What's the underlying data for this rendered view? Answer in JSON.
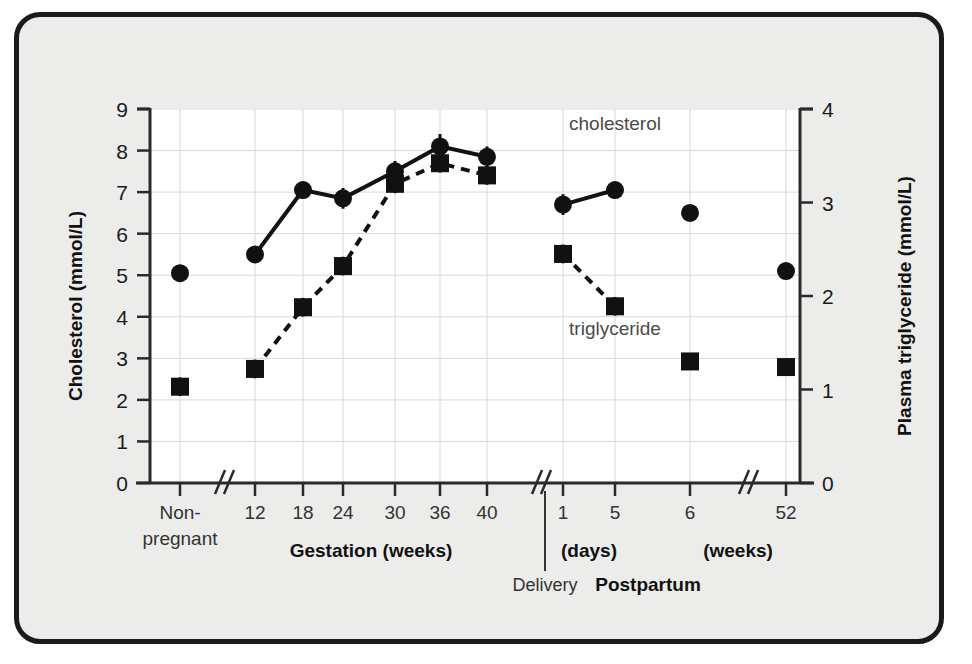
{
  "figure": {
    "background_color": "#ececea",
    "frame_color": "#1a1a1a",
    "plot_background": "#ffffff"
  },
  "chart_data": {
    "type": "line",
    "title": "",
    "xlabel": "",
    "ylabel": "Cholesterol (mmol/L)",
    "y2label": "Plasma triglyceride (mmol/L)",
    "ylim": [
      0,
      9
    ],
    "y2lim": [
      0,
      4
    ],
    "yticks": [
      "0",
      "1",
      "2",
      "3",
      "4",
      "5",
      "6",
      "7",
      "8",
      "9"
    ],
    "y2ticks": [
      "0",
      "1",
      "2",
      "3",
      "4"
    ],
    "grid": true,
    "legend_position": "inline-annotation",
    "categories": [
      "Non-pregnant",
      "12",
      "18",
      "24",
      "30",
      "36",
      "40",
      "1",
      "5",
      "6",
      "52"
    ],
    "axis_breaks": [
      "after Non-pregnant",
      "after 40 (Delivery)",
      "after 6 weeks"
    ],
    "series": [
      {
        "name": "cholesterol",
        "axis": "left",
        "marker": "circle",
        "linestyle": "solid",
        "units": "mmol/L",
        "values": [
          5.05,
          5.5,
          7.05,
          6.85,
          7.5,
          8.1,
          7.85,
          6.7,
          7.05,
          6.5,
          5.1
        ],
        "errors": [
          0.2,
          0.2,
          0.2,
          0.25,
          0.25,
          0.3,
          0.25,
          0.25,
          0.2,
          0.15,
          0.15
        ],
        "connected_segments": [
          [
            "12",
            "18",
            "24",
            "30",
            "36",
            "40"
          ],
          [
            "1",
            "5"
          ]
        ]
      },
      {
        "name": "triglyceride",
        "axis": "right",
        "marker": "square",
        "linestyle": "dashed",
        "units": "mmol/L",
        "values": [
          1.03,
          1.22,
          1.88,
          2.32,
          3.2,
          3.42,
          3.29,
          2.45,
          1.89,
          1.3,
          1.24
        ],
        "values_on_left_scale": [
          2.3,
          2.73,
          4.22,
          5.2,
          7.2,
          7.7,
          7.4,
          5.5,
          4.25,
          2.92,
          2.78
        ],
        "errors": [
          0.1,
          0.1,
          0.1,
          0.1,
          0.1,
          0.1,
          0.1,
          0.1,
          0.1,
          0.08,
          0.08
        ],
        "connected_segments": [
          [
            "12",
            "18",
            "24",
            "30",
            "36",
            "40"
          ],
          [
            "1",
            "5"
          ]
        ]
      }
    ],
    "annotations": [
      {
        "text": "cholesterol",
        "x_category": "5",
        "y_value": 8.5
      },
      {
        "text": "triglyceride",
        "x_category": "5",
        "y_value": 3.55
      }
    ],
    "group_labels": [
      {
        "text": "Gestation (weeks)",
        "covers": [
          "12",
          "18",
          "24",
          "30",
          "36",
          "40"
        ]
      },
      {
        "text": "(days)",
        "covers": [
          "1",
          "5"
        ]
      },
      {
        "text": "(weeks)",
        "covers": [
          "6",
          "52"
        ]
      },
      {
        "text": "Postpartum",
        "covers": [
          "1",
          "5",
          "6",
          "52"
        ]
      }
    ],
    "markers": [
      {
        "text": "Delivery",
        "type": "vertical-divider"
      }
    ],
    "category_multiline": {
      "Non-pregnant": [
        "Non-",
        "pregnant"
      ]
    }
  }
}
